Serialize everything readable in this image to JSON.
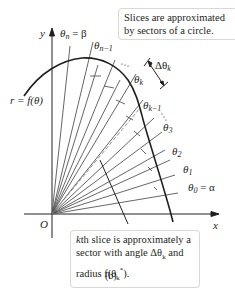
{
  "figure": {
    "caption": "(b)",
    "axes": {
      "x_label": "x",
      "y_label": "y",
      "origin_label": "O"
    },
    "curve_label": "r = f(θ)",
    "ray_labels": {
      "theta_n": "θ",
      "theta_n_sub": "n",
      "theta_n_eq": " = β",
      "theta_n1": "θ",
      "theta_n1_sub": "n−1",
      "theta_k": "θ",
      "theta_k_sub": "k",
      "theta_k1": "θ",
      "theta_k1_sub": "k−1",
      "theta_3": "θ",
      "theta_3_sub": "3",
      "theta_2": "θ",
      "theta_2_sub": "2",
      "theta_1": "θ",
      "theta_1_sub": "1",
      "theta_0": "θ",
      "theta_0_sub": "0",
      "theta_0_eq": " = α"
    },
    "delta_label": "Δθ",
    "delta_sub": "k",
    "callout_top": "Slices are approximated by sectors of a circle.",
    "callout_bottom": {
      "line1_italic": "k",
      "line1": "th slice is approximately a",
      "line2": "sector with angle Δθ",
      "line2_sub": "k",
      "line2_end": " and",
      "line3": "radius f(θ",
      "line3_sub": "k",
      "line3_sup": "*",
      "line3_end": ")."
    },
    "colors": {
      "ink": "#231f20",
      "ray": "#555555",
      "box_border": "#d8d8d8"
    }
  }
}
